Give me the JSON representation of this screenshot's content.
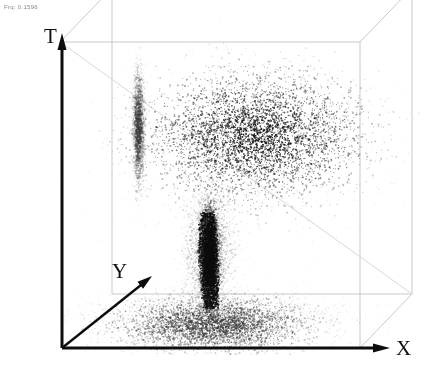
{
  "figure": {
    "annotation": "Frq: 0.1596",
    "background_color": "#ffffff",
    "point_color": "#1a1a1a",
    "axis_color": "#0d0d0d",
    "wire_color": "#c9c9c9"
  },
  "axes": {
    "t_label": "T",
    "x_label": "X",
    "y_label": "Y"
  },
  "chart_data": {
    "type": "scatter",
    "title": "",
    "xlabel": "X",
    "ylabel": "Y",
    "zlabel": "T",
    "grid": false,
    "legend": null,
    "projection": "3d-isometric-box",
    "box": {
      "front_left_x": 60,
      "front_right_x": 360,
      "top_y": 42,
      "bottom_y": 348,
      "depth_dx": 52,
      "depth_dy": -54
    },
    "features": [
      {
        "name": "plume-cap",
        "cx": 255,
        "cy": 135,
        "rx": 105,
        "ry": 62,
        "density": 1.0,
        "shade": "#141414"
      },
      {
        "name": "plume-stem",
        "cx": 209,
        "cy": 258,
        "rx": 9,
        "ry": 50,
        "density": 1.0,
        "shade": "#0f0f0f"
      },
      {
        "name": "stem-halo",
        "cx": 209,
        "cy": 250,
        "rx": 26,
        "ry": 58,
        "density": 0.45,
        "shade": "#606060"
      },
      {
        "name": "floor-deposit",
        "cx": 213,
        "cy": 324,
        "rx": 96,
        "ry": 27,
        "density": 0.85,
        "shade": "#3b3b3b"
      },
      {
        "name": "floor-plane-haze",
        "cx": 213,
        "cy": 318,
        "rx": 140,
        "ry": 36,
        "density": 0.3,
        "shade": "#a0a0a0"
      },
      {
        "name": "secondary-filament",
        "cx": 138,
        "cy": 128,
        "rx": 6,
        "ry": 56,
        "density": 0.5,
        "shade": "#3a3a3a"
      },
      {
        "name": "diffuse-halo",
        "cx": 245,
        "cy": 150,
        "rx": 150,
        "ry": 108,
        "density": 0.22,
        "shade": "#8d8d8d"
      }
    ]
  }
}
